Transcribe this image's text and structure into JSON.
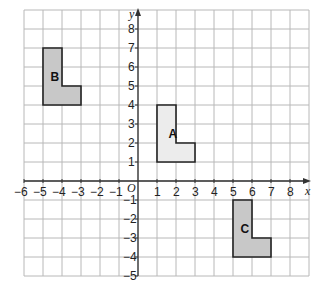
{
  "diagram": {
    "type": "coordinate-grid",
    "x_range": [
      -6,
      9
    ],
    "y_range": [
      -5,
      9
    ],
    "axis_labels": {
      "x": "x",
      "y": "y",
      "origin": "O"
    },
    "x_ticks": [
      -6,
      -5,
      -4,
      -3,
      -2,
      -1,
      1,
      2,
      3,
      4,
      5,
      6,
      7,
      8
    ],
    "y_ticks": [
      8,
      7,
      6,
      5,
      4,
      3,
      2,
      1,
      -1,
      -2,
      -3,
      -4,
      -5
    ],
    "shapes": [
      {
        "label": "A",
        "fill": "#ececec",
        "points": [
          [
            1,
            1
          ],
          [
            1,
            4
          ],
          [
            2,
            4
          ],
          [
            2,
            2
          ],
          [
            3,
            2
          ],
          [
            3,
            1
          ]
        ],
        "label_pos": [
          1.6,
          2.5
        ]
      },
      {
        "label": "B",
        "fill": "#c8c8c8",
        "points": [
          [
            -5,
            4
          ],
          [
            -5,
            7
          ],
          [
            -4,
            7
          ],
          [
            -4,
            5
          ],
          [
            -3,
            5
          ],
          [
            -3,
            4
          ]
        ],
        "label_pos": [
          -4.6,
          5.5
        ]
      },
      {
        "label": "C",
        "fill": "#c8c8c8",
        "points": [
          [
            5,
            -4
          ],
          [
            5,
            -1
          ],
          [
            6,
            -1
          ],
          [
            6,
            -3
          ],
          [
            7,
            -3
          ],
          [
            7,
            -4
          ]
        ],
        "label_pos": [
          5.4,
          -2.5
        ]
      }
    ],
    "colors": {
      "grid": "#b8b8b8",
      "axis": "#333333",
      "outline": "#222222"
    }
  }
}
